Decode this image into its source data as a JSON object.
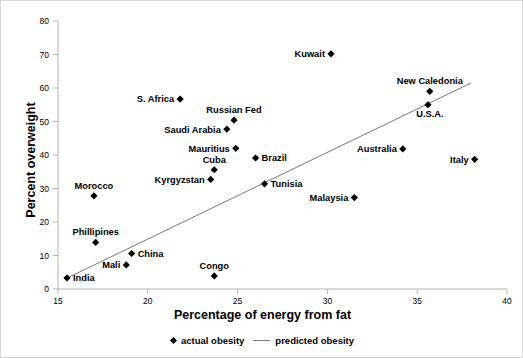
{
  "chart_data": {
    "type": "scatter",
    "title": "",
    "xlabel": "Percentage of energy from fat",
    "ylabel": "Percent overweight",
    "xlim": [
      15,
      40
    ],
    "ylim": [
      0,
      80
    ],
    "xticks": [
      "15",
      "20",
      "25",
      "30",
      "35",
      "40"
    ],
    "yticks": [
      "0",
      "10",
      "20",
      "30",
      "40",
      "50",
      "60",
      "70",
      "80"
    ],
    "grid": false,
    "legend_position": "bottom-center",
    "legend": [
      {
        "label": "actual obesity",
        "marker": "diamond",
        "color": "#000000"
      },
      {
        "label": "predicted obesity",
        "marker": "line",
        "color": "#7a7a7a"
      }
    ],
    "series": [
      {
        "name": "actual obesity",
        "points": [
          {
            "label": "India",
            "x": 15.5,
            "y": 3.3,
            "label_pos": "right"
          },
          {
            "label": "Morocco",
            "x": 17.0,
            "y": 27.8,
            "label_pos": "above"
          },
          {
            "label": "Phillipines",
            "x": 17.1,
            "y": 13.9,
            "label_pos": "above"
          },
          {
            "label": "Mali",
            "x": 18.8,
            "y": 7.2,
            "label_pos": "left"
          },
          {
            "label": "China",
            "x": 19.1,
            "y": 10.6,
            "label_pos": "right"
          },
          {
            "label": "S. Africa",
            "x": 21.8,
            "y": 56.7,
            "label_pos": "left"
          },
          {
            "label": "Kyrgyzstan",
            "x": 23.5,
            "y": 32.7,
            "label_pos": "left"
          },
          {
            "label": "Congo",
            "x": 23.7,
            "y": 3.9,
            "label_pos": "above"
          },
          {
            "label": "Cuba",
            "x": 23.7,
            "y": 35.6,
            "label_pos": "above"
          },
          {
            "label": "Saudi Arabia",
            "x": 24.4,
            "y": 47.7,
            "label_pos": "left"
          },
          {
            "label": "Russian Fed",
            "x": 24.8,
            "y": 50.4,
            "label_pos": "above"
          },
          {
            "label": "Mauritius",
            "x": 24.9,
            "y": 42.0,
            "label_pos": "left"
          },
          {
            "label": "Brazil",
            "x": 26.0,
            "y": 39.1,
            "label_pos": "right"
          },
          {
            "label": "Tunisia",
            "x": 26.5,
            "y": 31.4,
            "label_pos": "right"
          },
          {
            "label": "Kuwait",
            "x": 30.2,
            "y": 70.2,
            "label_pos": "left"
          },
          {
            "label": "Malaysia",
            "x": 31.5,
            "y": 27.3,
            "label_pos": "left"
          },
          {
            "label": "Australia",
            "x": 34.2,
            "y": 41.8,
            "label_pos": "left"
          },
          {
            "label": "U.S.A.",
            "x": 35.6,
            "y": 55.0,
            "label_pos": "below-right"
          },
          {
            "label": "New Caledonia",
            "x": 35.7,
            "y": 59.0,
            "label_pos": "above"
          },
          {
            "label": "Italy",
            "x": 38.2,
            "y": 38.7,
            "label_pos": "left"
          }
        ]
      },
      {
        "name": "predicted obesity",
        "type": "line",
        "endpoints": [
          {
            "x": 15.4,
            "y": 3.0
          },
          {
            "x": 38.0,
            "y": 61.5
          }
        ]
      }
    ]
  }
}
